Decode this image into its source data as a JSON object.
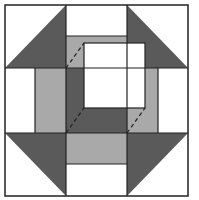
{
  "diagram": {
    "colors": {
      "dark": "#5a5a5a",
      "light": "#a9a9a9",
      "white": "#ffffff",
      "line": "#222222"
    },
    "pieces": [
      {
        "name": "corner-triangle-top-left",
        "fill": "dark"
      },
      {
        "name": "corner-triangle-top-right",
        "fill": "dark"
      },
      {
        "name": "corner-triangle-bottom-left",
        "fill": "dark"
      },
      {
        "name": "corner-triangle-bottom-right",
        "fill": "dark"
      },
      {
        "name": "strip-top",
        "fill": "light"
      },
      {
        "name": "strip-left",
        "fill": "light"
      },
      {
        "name": "strip-right",
        "fill": "light"
      },
      {
        "name": "strip-bottom",
        "fill": "light"
      },
      {
        "name": "center-shadow",
        "fill": "dark"
      },
      {
        "name": "inset-square",
        "fill": "white"
      }
    ]
  }
}
